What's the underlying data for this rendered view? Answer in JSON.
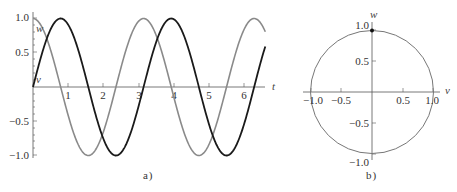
{
  "chart_data": [
    {
      "type": "line",
      "panel": "a",
      "caption": "a )",
      "xlabel": "t",
      "ylabel": "",
      "xlim": [
        0,
        6.6
      ],
      "ylim": [
        -1.0,
        1.0
      ],
      "x_ticks": [
        "1",
        "2",
        "3",
        "4",
        "5",
        "6"
      ],
      "y_ticks": [
        "1.0",
        "0.5",
        "−0.5",
        "−1.0"
      ],
      "grid": false,
      "series": [
        {
          "name": "v",
          "label": "v",
          "formula": "sin(2t)",
          "color": "#1a1a1a",
          "x": [
            0,
            0.785,
            1.571,
            2.356,
            3.142,
            3.927,
            4.712,
            5.498,
            6.283,
            6.6
          ],
          "values": [
            0,
            1.0,
            0,
            -1.0,
            0,
            1.0,
            0,
            -1.0,
            0,
            0.59
          ]
        },
        {
          "name": "w",
          "label": "w",
          "formula": "cos(2t)",
          "color": "#8a8a8a",
          "x": [
            0,
            0.785,
            1.571,
            2.356,
            3.142,
            3.927,
            4.712,
            5.498,
            6.283,
            6.6
          ],
          "values": [
            1.0,
            0,
            -1.0,
            0,
            1.0,
            0,
            -1.0,
            0,
            1.0,
            0.81
          ]
        }
      ]
    },
    {
      "type": "line",
      "panel": "b",
      "caption": "b )",
      "xlabel": "v",
      "ylabel": "w",
      "xlim": [
        -1.0,
        1.0
      ],
      "ylim": [
        -1.0,
        1.0
      ],
      "x_ticks": [
        "−1.0",
        "−0.5",
        "0.5",
        "1.0"
      ],
      "y_ticks": [
        "1.0",
        "0.5",
        "−0.5",
        "−1.0"
      ],
      "grid": false,
      "series": [
        {
          "name": "phase",
          "description": "unit circle v^2 + w^2 = 1",
          "color": "#777777",
          "x": [
            1,
            0,
            -1,
            0,
            1
          ],
          "values": [
            0,
            1,
            0,
            -1,
            0
          ]
        }
      ],
      "marker": {
        "v": 0,
        "w": 1.0
      }
    }
  ]
}
